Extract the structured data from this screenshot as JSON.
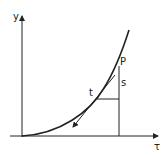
{
  "diagram": {
    "labels": {
      "y_axis": "y",
      "x_axis": "τ",
      "point_p": "P",
      "point_t": "t",
      "segment_s": "s"
    },
    "colors": {
      "stroke": "#222222",
      "background": "#ffffff"
    }
  }
}
